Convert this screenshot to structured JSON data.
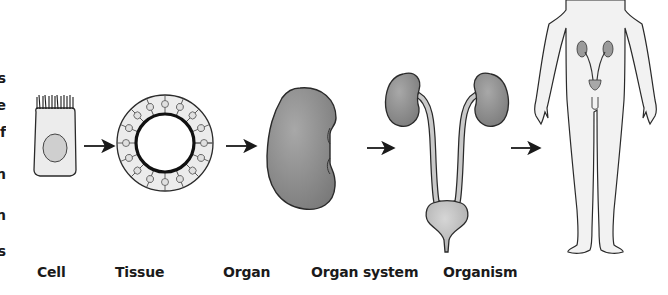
{
  "diagram": {
    "stages": [
      {
        "id": "cell",
        "label": "Cell"
      },
      {
        "id": "tissue",
        "label": "Tissue"
      },
      {
        "id": "organ",
        "label": "Organ"
      },
      {
        "id": "organ-system",
        "label": "Organ system"
      },
      {
        "id": "organism",
        "label": "Organism"
      }
    ],
    "arrows": 4,
    "left_margin_fragments": [
      "s",
      "e",
      "f",
      "n",
      "n",
      "s"
    ],
    "colors": {
      "outline": "#2a2a2a",
      "cell_fill": "#ececec",
      "nucleus_fill": "#cfcfcf",
      "organ_fill": "#8a8a8a",
      "bladder_fill": "#bdbdbd",
      "body_fill": "#f2f2f2",
      "label": "#1a1a1a"
    }
  }
}
